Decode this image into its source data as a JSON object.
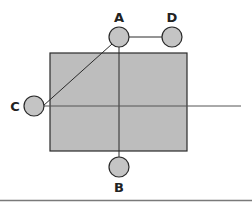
{
  "diagram": {
    "colors": {
      "background": "#ffffff",
      "rect_fill": "#bdbdbd",
      "node_fill": "#c4c4c4",
      "stroke": "#2a2a2a",
      "axis_line": "#666666",
      "bottom_rule": "#7a7a7a"
    },
    "rectangle": {
      "x": 50,
      "y": 53,
      "width": 137,
      "height": 98
    },
    "nodes": [
      {
        "id": "A",
        "label": "A",
        "cx": 119,
        "cy": 37,
        "r": 10,
        "label_x": 119,
        "label_y": 22
      },
      {
        "id": "D",
        "label": "D",
        "cx": 172,
        "cy": 37,
        "r": 10,
        "label_x": 172,
        "label_y": 22
      },
      {
        "id": "C",
        "label": "C",
        "cx": 34,
        "cy": 106,
        "r": 10,
        "label_x": 15,
        "label_y": 111
      },
      {
        "id": "B",
        "label": "B",
        "cx": 119,
        "cy": 167,
        "r": 10,
        "label_x": 119,
        "label_y": 192
      }
    ],
    "lines": [
      {
        "name": "A-D",
        "x1": 129,
        "y1": 37,
        "x2": 162,
        "y2": 37
      },
      {
        "name": "A-B vertical",
        "x1": 119,
        "y1": 47,
        "x2": 119,
        "y2": 157
      },
      {
        "name": "A-C diagonal",
        "x1": 112,
        "y1": 44,
        "x2": 43,
        "y2": 106
      },
      {
        "name": "horizontal axis",
        "x1": 44,
        "y1": 106,
        "x2": 241,
        "y2": 106
      }
    ],
    "bottom_rule_y": 200
  }
}
